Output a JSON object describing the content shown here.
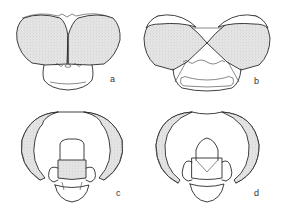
{
  "figure": {
    "panels": [
      {
        "id": "a",
        "label": "a",
        "view": "frontal, eyes contiguous"
      },
      {
        "id": "b",
        "label": "b",
        "view": "frontal, eyes meeting at a point"
      },
      {
        "id": "c",
        "label": "c",
        "view": "ventral/posterior, mouthparts"
      },
      {
        "id": "d",
        "label": "d",
        "view": "ventral/posterior, mouthparts"
      }
    ],
    "colors": {
      "line": "#2a2a2a",
      "stipple": "#d9d9d9",
      "background": "#ffffff"
    }
  }
}
